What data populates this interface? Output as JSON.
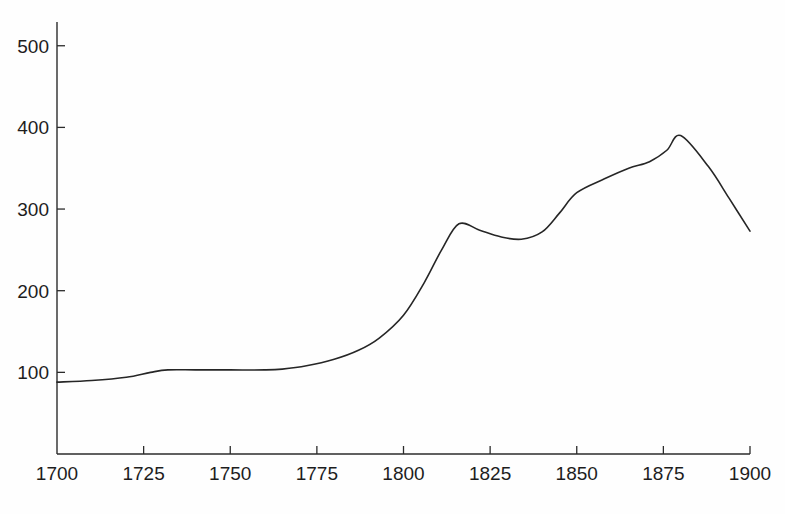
{
  "chart_data": {
    "type": "line",
    "title": "",
    "subtitle": "",
    "xlabel": "",
    "ylabel": "",
    "xlim": [
      1700,
      1900
    ],
    "ylim": [
      0,
      510
    ],
    "grid": false,
    "legend": null,
    "annotations": [],
    "xticks": [
      1700,
      1725,
      1750,
      1775,
      1800,
      1825,
      1850,
      1875,
      1900
    ],
    "xtick_labels": [
      "1700",
      "1725",
      "1750",
      "1775",
      "1800",
      "1825",
      "1850",
      "1875",
      "1900"
    ],
    "yticks": [
      100,
      200,
      300,
      400,
      500
    ],
    "ytick_labels": [
      "100",
      "200",
      "300",
      "400",
      "500"
    ],
    "tick_direction": "in",
    "spines": [
      "left",
      "bottom"
    ],
    "line_color": "#262626",
    "line_width": 1.6,
    "series": [
      {
        "name": "series-1",
        "x": [
          1700,
          1710,
          1720,
          1727,
          1732,
          1740,
          1750,
          1760,
          1765,
          1772,
          1780,
          1787,
          1793,
          1800,
          1806,
          1811,
          1816,
          1822,
          1828,
          1834,
          1840,
          1845,
          1850,
          1858,
          1865,
          1871,
          1876,
          1880,
          1888,
          1894,
          1900
        ],
        "y": [
          88,
          90,
          94,
          100,
          103,
          103,
          103,
          103,
          104,
          108,
          116,
          127,
          142,
          170,
          210,
          250,
          282,
          274,
          266,
          263,
          272,
          295,
          320,
          337,
          350,
          358,
          372,
          390,
          352,
          313,
          273
        ]
      }
    ]
  }
}
